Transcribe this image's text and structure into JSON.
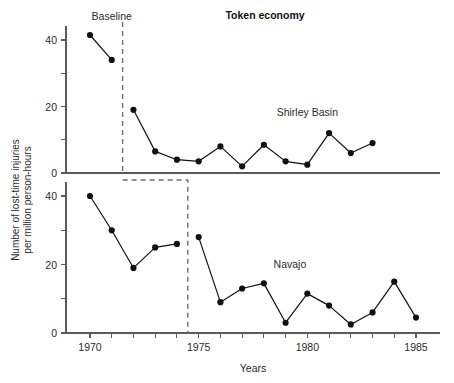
{
  "chart_data": {
    "type": "line",
    "title": "Token economy",
    "xlabel": "Years",
    "ylabel": "Number of lost-time injuries per million person-hours",
    "ylabel_line1": "Number of lost-time injuries",
    "ylabel_line2": "per million person-hours",
    "grid": false,
    "legend_position": "inline annotation",
    "xlim": [
      1969.1,
      1985.9
    ],
    "x_ticks": [
      1970,
      1971,
      1972,
      1973,
      1974,
      1975,
      1976,
      1977,
      1978,
      1979,
      1980,
      1981,
      1982,
      1983,
      1984,
      1985
    ],
    "x_tick_labels": [
      "1970",
      "",
      "",
      "",
      "",
      "1975",
      "",
      "",
      "",
      "",
      "1980",
      "",
      "",
      "",
      "",
      "1985"
    ],
    "panels": [
      {
        "name": "Shirley Basin",
        "annotation": "Shirley Basin",
        "annotation_x": 1980.0,
        "annotation_y": 17,
        "baseline_label": "Baseline",
        "baseline_label_x": 1971.0,
        "baseline_label_y": 46,
        "ylim": [
          0,
          44
        ],
        "y_ticks": [
          0,
          10,
          20,
          30,
          40
        ],
        "y_tick_labels": [
          "0",
          "",
          "20",
          "",
          "40"
        ],
        "phase_change_x": 1971.5,
        "series": [
          {
            "name": "Baseline",
            "x": [
              1970,
              1971
            ],
            "values": [
              41.5,
              34
            ]
          },
          {
            "name": "Token economy",
            "x": [
              1972,
              1973,
              1974,
              1975,
              1976,
              1977,
              1978,
              1979,
              1980,
              1981,
              1982,
              1983
            ],
            "values": [
              19,
              6.5,
              4,
              3.5,
              8,
              2,
              8.5,
              3.5,
              2.5,
              12,
              6,
              9
            ]
          }
        ]
      },
      {
        "name": "Navajo",
        "annotation": "Navajo",
        "annotation_x": 1979.2,
        "annotation_y": 19,
        "ylim": [
          0,
          44
        ],
        "y_ticks": [
          0,
          10,
          20,
          30,
          40
        ],
        "y_tick_labels": [
          "0",
          "",
          "20",
          "",
          "40"
        ],
        "phase_change_x": 1974.5,
        "series": [
          {
            "name": "Baseline",
            "x": [
              1970,
              1971,
              1972,
              1973,
              1974
            ],
            "values": [
              40,
              30,
              19,
              25,
              26
            ]
          },
          {
            "name": "Token economy",
            "x": [
              1975,
              1976,
              1977,
              1978,
              1979,
              1980,
              1981,
              1982,
              1983,
              1984,
              1985
            ],
            "values": [
              28,
              9,
              13,
              14.5,
              3,
              11.5,
              8,
              2.5,
              6,
              15,
              4.5
            ]
          }
        ]
      }
    ]
  }
}
